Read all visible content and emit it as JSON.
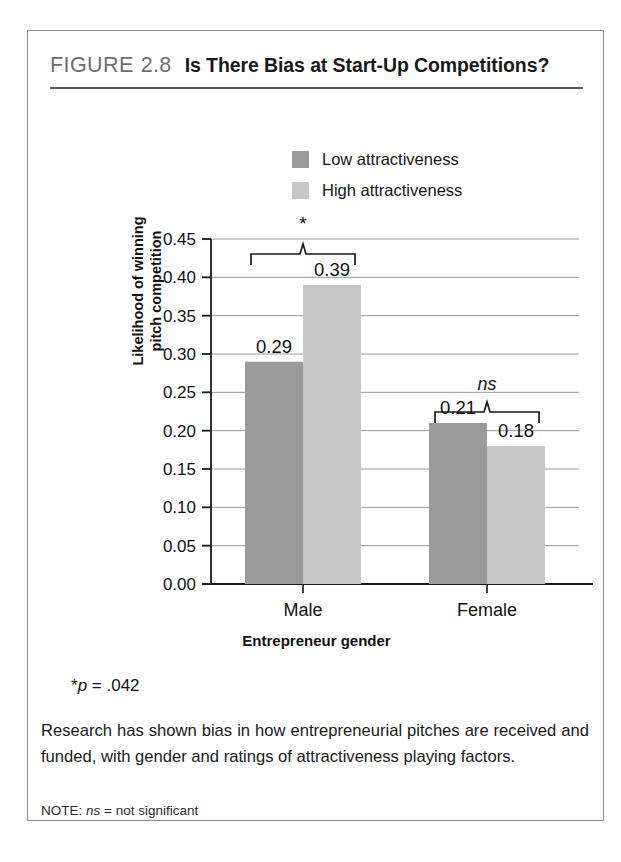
{
  "figure": {
    "label": "FIGURE",
    "number": "2.8",
    "title": "Is There Bias at Start-Up Competitions?"
  },
  "legend": {
    "items": [
      {
        "label": "Low attractiveness",
        "color": "#9b9b9b"
      },
      {
        "label": "High attractiveness",
        "color": "#c6c6c6"
      }
    ]
  },
  "axes": {
    "y_title_line1": "Likelihood of winning",
    "y_title_line2": "pitch competition",
    "x_title": "Entrepreneur gender"
  },
  "footnotes": {
    "p_value_star": "*",
    "p_value_italic": "p",
    "p_value_rest": " = .042",
    "caption": "Research has shown bias in how entrepreneurial pitches are received and funded, with gender and ratings of attractiveness playing factors.",
    "note_prefix": "NOTE: ",
    "note_italic": "ns",
    "note_rest": " = not significant"
  },
  "chart_data": {
    "type": "bar",
    "title": "Is There Bias at Start-Up Competitions?",
    "xlabel": "Entrepreneur gender",
    "ylabel": "Likelihood of winning pitch competition",
    "categories": [
      "Male",
      "Female"
    ],
    "series": [
      {
        "name": "Low attractiveness",
        "color": "#9b9b9b",
        "values": [
          0.29,
          0.21
        ]
      },
      {
        "name": "High attractiveness",
        "color": "#c6c6c6",
        "values": [
          0.39,
          0.18
        ]
      }
    ],
    "value_labels": [
      "0.29",
      "0.39",
      "0.21",
      "0.18"
    ],
    "ylim": [
      0.0,
      0.45
    ],
    "ytick_labels": [
      "0.45",
      "0.40",
      "0.35",
      "0.30",
      "0.25",
      "0.20",
      "0.15",
      "0.10",
      "0.05",
      "0.00"
    ],
    "ytick_values": [
      0.45,
      0.4,
      0.35,
      0.3,
      0.25,
      0.2,
      0.15,
      0.1,
      0.05,
      0.0
    ],
    "grid": true,
    "legend_position": "top-center",
    "annotations": [
      {
        "group": "Male",
        "text": "*",
        "type": "bracket",
        "meaning": "significant"
      },
      {
        "group": "Female",
        "text": "ns",
        "type": "bracket",
        "meaning": "not significant"
      }
    ]
  }
}
